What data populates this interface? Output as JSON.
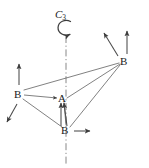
{
  "figure": {
    "background_color": "#ffffff",
    "line_color": "#4a4a4a",
    "text_color": "#1a1a1a",
    "width": 149,
    "height": 168
  },
  "symmetry": {
    "axis_label_main": "C",
    "axis_label_sub": "3",
    "axis_label_full": "C3",
    "axis_type": "dash-dot vertical line",
    "rotation_arrow": "counterclockwise-arc"
  },
  "atoms": [
    {
      "id": "center",
      "label": "A",
      "x": 62,
      "y": 99
    },
    {
      "id": "b-left",
      "label": "B",
      "x": 18,
      "y": 95
    },
    {
      "id": "b-right",
      "label": "B",
      "x": 124,
      "y": 62
    },
    {
      "id": "b-bottom",
      "label": "B",
      "x": 65,
      "y": 131
    }
  ],
  "bonds": [
    {
      "from": "center",
      "to": "b-left"
    },
    {
      "from": "center",
      "to": "b-right"
    },
    {
      "from": "center",
      "to": "b-bottom"
    },
    {
      "from": "b-left",
      "to": "b-right"
    },
    {
      "from": "b-left",
      "to": "b-bottom"
    },
    {
      "from": "b-bottom",
      "to": "b-right"
    }
  ],
  "vectors": [
    {
      "id": "v-left-up",
      "atom": "b-left",
      "direction": "up"
    },
    {
      "id": "v-left-downleft",
      "atom": "b-left",
      "direction": "down-left"
    },
    {
      "id": "v-right-up",
      "atom": "b-right",
      "direction": "up"
    },
    {
      "id": "v-right-upleft",
      "atom": "b-right",
      "direction": "up-left"
    },
    {
      "id": "v-bottom-up-a",
      "atom": "b-bottom",
      "direction": "up"
    },
    {
      "id": "v-bottom-up-b",
      "atom": "b-bottom",
      "direction": "up-slanted"
    },
    {
      "id": "v-bottom-right",
      "atom": "b-bottom",
      "direction": "right"
    },
    {
      "id": "v-center-in",
      "atom": "center",
      "direction": "right-into-A"
    }
  ]
}
